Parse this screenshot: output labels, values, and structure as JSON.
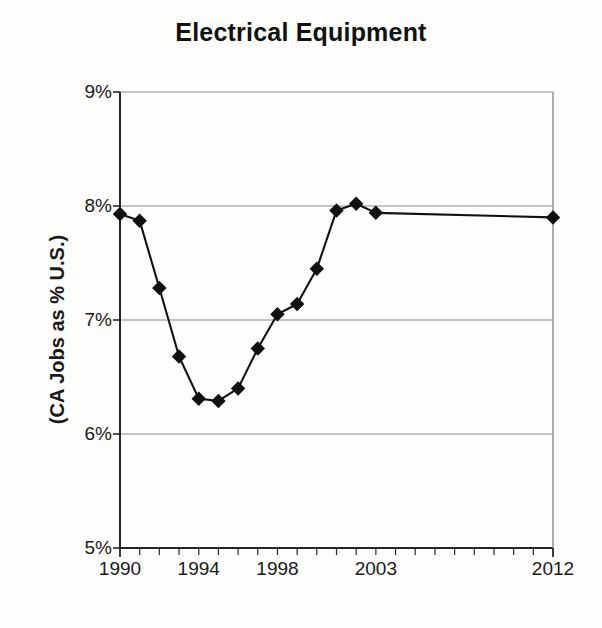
{
  "chart_data": {
    "type": "line",
    "title": "Electrical Equipment",
    "xlabel": "",
    "ylabel": "(CA Jobs as % U.S.)",
    "ylim": [
      5,
      9
    ],
    "xlim": [
      1990,
      2012
    ],
    "grid": true,
    "legend": false,
    "y_tick_labels": [
      "9%",
      "8%",
      "7%",
      "6%",
      "5%"
    ],
    "y_tick_values": [
      9,
      8,
      7,
      6,
      5
    ],
    "x_tick_labels": [
      "1990",
      "1994",
      "1998",
      "2003",
      "2012"
    ],
    "x_tick_values": [
      1990,
      1994,
      1998,
      2003,
      2012
    ],
    "x_minor_tick_count": 23,
    "marker": "diamond",
    "marker_color": "#111111",
    "line_color": "#111111",
    "x": [
      1990,
      1991,
      1992,
      1993,
      1994,
      1995,
      1996,
      1997,
      1998,
      1999,
      2000,
      2001,
      2002,
      2003,
      2012
    ],
    "values": [
      7.93,
      7.87,
      7.28,
      6.68,
      6.31,
      6.29,
      6.4,
      6.75,
      7.05,
      7.14,
      7.45,
      7.96,
      8.02,
      7.94,
      7.9
    ],
    "series": [
      {
        "name": "CA Jobs as % U.S.",
        "values": [
          7.93,
          7.87,
          7.28,
          6.68,
          6.31,
          6.29,
          6.4,
          6.75,
          7.05,
          7.14,
          7.45,
          7.96,
          8.02,
          7.94,
          7.9
        ]
      }
    ],
    "annotations": []
  },
  "axis": {
    "y_title": "(CA Jobs as % U.S.)"
  }
}
